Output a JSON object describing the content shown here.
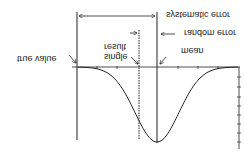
{
  "diagram": {
    "orientation": "vertically flipped",
    "labels": {
      "systematic_error": "systematic error",
      "random_error": "random error",
      "mean": "mean",
      "single_result_line1": "single",
      "single_result_line2": "result",
      "true_value": "true value"
    },
    "colors": {
      "ink": "#222222",
      "background": "#ffffff"
    },
    "curve": {
      "type": "gaussian",
      "description": "bell curve centered on mean"
    }
  }
}
